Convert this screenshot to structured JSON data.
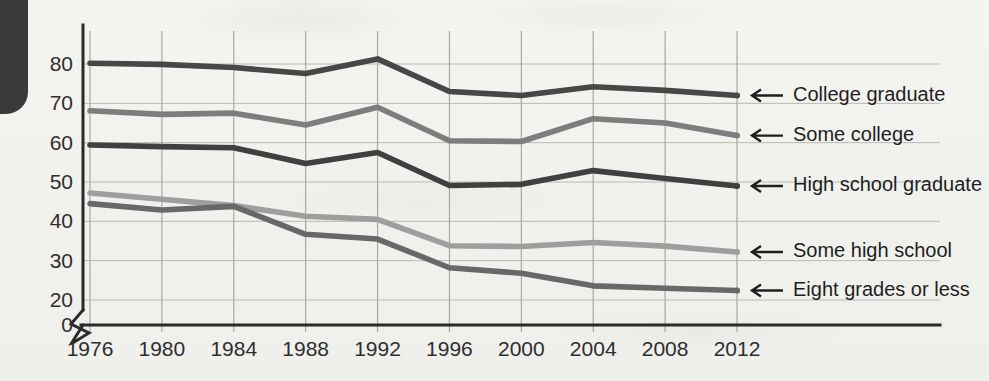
{
  "chart_data": {
    "type": "line",
    "title": "",
    "xlabel": "",
    "ylabel": "",
    "categories": [
      1976,
      1980,
      1984,
      1988,
      1992,
      1996,
      2000,
      2004,
      2008,
      2012
    ],
    "xtick_labels": [
      "1976",
      "1980",
      "1984",
      "1988",
      "1992",
      "1996",
      "2000",
      "2004",
      "2008",
      "2012"
    ],
    "ytick_labels": [
      "0",
      "20",
      "30",
      "40",
      "50",
      "60",
      "70",
      "80"
    ],
    "ytick_values": [
      0,
      20,
      30,
      40,
      50,
      60,
      70,
      80
    ],
    "ylim": [
      20,
      85
    ],
    "axis_break": true,
    "axis_break_symbol": "zigzag",
    "grid": true,
    "legend_position": "right-inline-arrows",
    "series": [
      {
        "name": "College graduate",
        "color": "#474747",
        "values": [
          80.2,
          79.9,
          79.1,
          77.6,
          81.3,
          73.0,
          72.0,
          74.2,
          73.3,
          72.0
        ]
      },
      {
        "name": "Some college",
        "color": "#7d7d7d",
        "values": [
          68.1,
          67.2,
          67.5,
          64.5,
          69.0,
          60.5,
          60.3,
          66.1,
          65.0,
          61.8
        ]
      },
      {
        "name": "High school graduate",
        "color": "#404040",
        "values": [
          59.4,
          59.0,
          58.7,
          54.7,
          57.5,
          49.1,
          49.4,
          52.9,
          50.9,
          49.0
        ]
      },
      {
        "name": "Some high school",
        "color": "#9e9e9e",
        "values": [
          47.2,
          45.6,
          44.0,
          41.3,
          40.5,
          33.8,
          33.6,
          34.6,
          33.7,
          32.2
        ]
      },
      {
        "name": "Eight grades or less",
        "color": "#686868",
        "values": [
          44.5,
          42.9,
          43.8,
          36.7,
          35.5,
          28.2,
          26.8,
          23.6,
          23.0,
          22.4
        ]
      }
    ],
    "legend_labels": [
      "College graduate",
      "Some college",
      "High school graduate",
      "Some high school",
      "Eight grades or less"
    ],
    "legend_arrow_glyph": "left-arrow"
  },
  "colors": {
    "background": "#f2f2ef",
    "axis": "#2b2b2b",
    "gridline": "#b9b9b4",
    "text": "#1f1f1f"
  }
}
